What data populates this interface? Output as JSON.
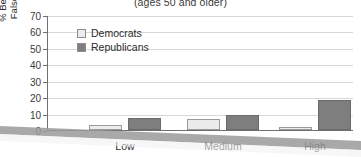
{
  "chart_data": {
    "type": "bar",
    "title": "(ages 50 and older)",
    "xlabel": "",
    "ylabel_line1": "% Believing",
    "ylabel_line2": "Falsehood",
    "categories": [
      "Low",
      "Medium",
      "High"
    ],
    "series": [
      {
        "name": "Democrats",
        "color": "#ececec",
        "values": [
          3,
          7,
          2
        ]
      },
      {
        "name": "Republicans",
        "color": "#7e7e7e",
        "values": [
          7.5,
          9,
          18.5
        ]
      }
    ],
    "ylim": [
      0,
      70
    ],
    "yticks": [
      70,
      60,
      50,
      40,
      30,
      20,
      10,
      0
    ],
    "grid": true,
    "legend_position": "upper-left-inside"
  },
  "legend": {
    "items": [
      {
        "label": "Democrats"
      },
      {
        "label": "Republicans"
      }
    ]
  },
  "colors": {
    "democrat_fill": "#ececec",
    "republican_fill": "#7e7e7e",
    "axis": "#6f6f6f",
    "gridline": "#d8d8d8"
  }
}
